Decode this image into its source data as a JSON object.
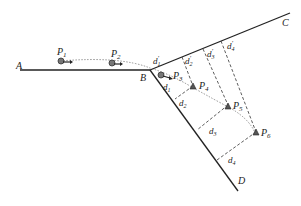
{
  "figure": {
    "lines": {
      "A_label": "A",
      "B_label": "B",
      "C_label": "C",
      "D_label": "D"
    },
    "points": {
      "P1": {
        "label": "P",
        "sub": "1",
        "shape": "circle"
      },
      "P2": {
        "label": "P",
        "sub": "2",
        "shape": "circle"
      },
      "P3": {
        "label": "P",
        "sub": "3",
        "shape": "circle"
      },
      "P4": {
        "label": "P",
        "sub": "4",
        "shape": "triangle"
      },
      "P5": {
        "label": "P",
        "sub": "5",
        "shape": "triangle"
      },
      "P6": {
        "label": "P",
        "sub": "6",
        "shape": "triangle"
      }
    },
    "distances_upper": [
      {
        "label": "d",
        "sub": "1",
        "prime": "′"
      },
      {
        "label": "d",
        "sub": "2",
        "prime": "′"
      },
      {
        "label": "d",
        "sub": "3",
        "prime": "′"
      },
      {
        "label": "d",
        "sub": "4",
        "prime": "′"
      }
    ],
    "distances_lower": [
      {
        "label": "d",
        "sub": "1"
      },
      {
        "label": "d",
        "sub": "2"
      },
      {
        "label": "d",
        "sub": "3"
      },
      {
        "label": "d",
        "sub": "4"
      }
    ],
    "colors": {
      "line": "#222222",
      "marker_fill": "#777777"
    }
  }
}
